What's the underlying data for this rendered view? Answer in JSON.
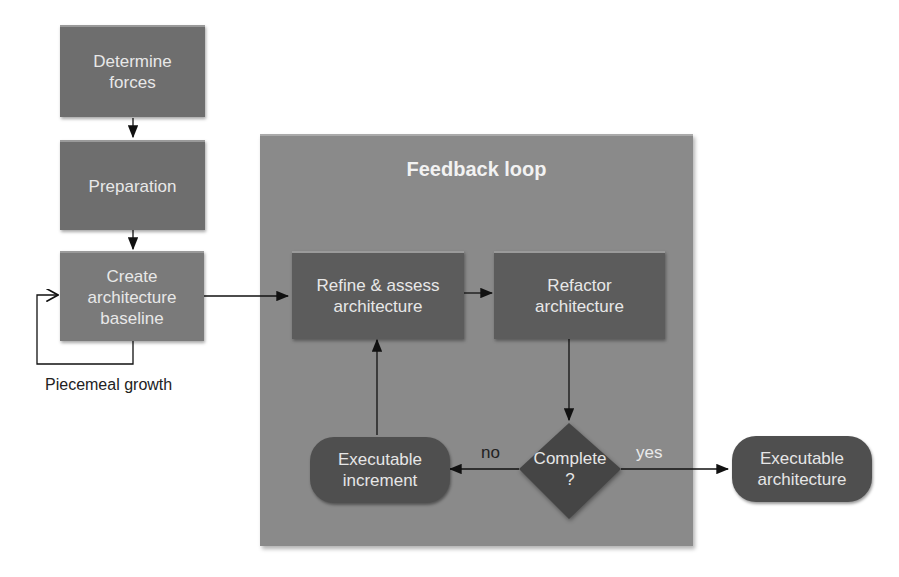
{
  "nodes": {
    "determine_forces": "Determine\nforces",
    "preparation": "Preparation",
    "create_baseline": "Create\narchitecture\nbaseline",
    "refine_assess": "Refine & assess\narchitecture",
    "refactor": "Refactor\narchitecture",
    "complete": "Complete\n?",
    "executable_increment": "Executable\nincrement",
    "executable_architecture": "Executable\narchitecture"
  },
  "frame": {
    "title": "Feedback loop"
  },
  "edge_labels": {
    "piecemeal": "Piecemeal growth",
    "no": "no",
    "yes": "yes"
  }
}
